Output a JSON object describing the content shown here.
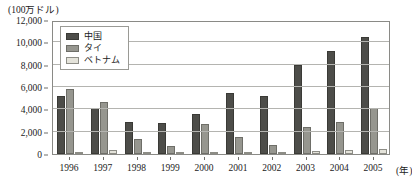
{
  "chart_data": {
    "type": "bar",
    "title": "",
    "unit_caption": "(100万ドル)",
    "xlabel": "(年)",
    "ylabel": "",
    "categories": [
      "1996",
      "1997",
      "1998",
      "1999",
      "2000",
      "2001",
      "2002",
      "2003",
      "2004",
      "2005"
    ],
    "ylim": [
      0,
      12000
    ],
    "ytick_values": [
      0,
      2000,
      4000,
      6000,
      8000,
      10000,
      12000
    ],
    "ytick_labels": [
      "0",
      "2,000",
      "4,000",
      "6,000",
      "8,000",
      "10,000",
      "12,000"
    ],
    "grid": true,
    "legend_position": "top-left-inside",
    "series": [
      {
        "name": "中国",
        "color": "#4d4d49",
        "values": [
          5200,
          4100,
          2900,
          2750,
          3600,
          5500,
          5200,
          8000,
          9200,
          10500
        ]
      },
      {
        "name": "タイ",
        "color": "#96968f",
        "values": [
          5800,
          4700,
          1300,
          700,
          2700,
          1500,
          800,
          2400,
          2900,
          4100
        ]
      },
      {
        "name": "ベトナム",
        "color": "#e4e3da",
        "values": [
          180,
          330,
          150,
          120,
          160,
          200,
          180,
          230,
          330,
          420
        ]
      }
    ]
  }
}
